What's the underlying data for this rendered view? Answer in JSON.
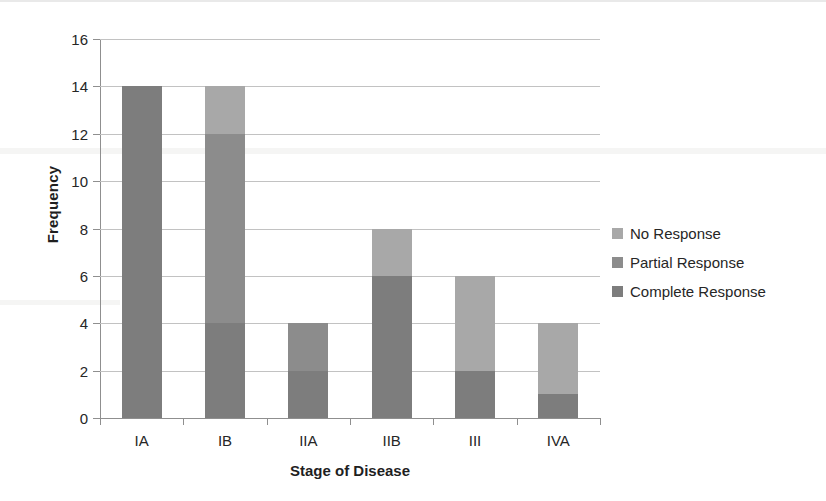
{
  "chart_data": {
    "type": "bar",
    "subtype": "stacked-bar",
    "title": "",
    "xlabel": "Stage of Disease",
    "ylabel": "Frequency",
    "categories": [
      "IA",
      "IB",
      "IIA",
      "IIB",
      "III",
      "IVA"
    ],
    "ylim": [
      0,
      16
    ],
    "ytick_step": 2,
    "yticks": [
      0,
      2,
      4,
      6,
      8,
      10,
      12,
      14,
      16
    ],
    "ytick_labels": [
      "0",
      "2",
      "4",
      "6",
      "8",
      "10",
      "12",
      "14",
      "16"
    ],
    "grid": true,
    "legend_position": "right",
    "series": [
      {
        "name": "Complete Response",
        "color": "#7d7d7d",
        "values": [
          14,
          4,
          2,
          6,
          2,
          1
        ]
      },
      {
        "name": "Partial Response",
        "color": "#8c8c8c",
        "values": [
          0,
          8,
          2,
          0,
          0,
          0
        ]
      },
      {
        "name": "No Response",
        "color": "#a8a8a8",
        "values": [
          0,
          2,
          0,
          2,
          4,
          3
        ]
      }
    ],
    "stack_order_bottom_to_top": [
      "Complete Response",
      "Partial Response",
      "No Response"
    ],
    "totals": [
      14,
      14,
      4,
      8,
      6,
      4
    ]
  },
  "legend": {
    "items": [
      {
        "label": "No Response",
        "color": "#a8a8a8"
      },
      {
        "label": "Partial Response",
        "color": "#8c8c8c"
      },
      {
        "label": "Complete Response",
        "color": "#7d7d7d"
      }
    ]
  },
  "axes": {
    "y_title": "Frequency",
    "x_title": "Stage of Disease"
  },
  "colors": {
    "axis": "#8f8f8f",
    "grid": "#c2c2c2",
    "text": "#262626",
    "background": "#ffffff"
  }
}
